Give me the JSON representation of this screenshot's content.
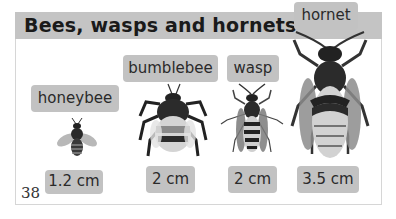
{
  "page": {
    "title": "Bees, wasps and hornets",
    "page_number": "38"
  },
  "insects": [
    {
      "name": "honeybee",
      "size": "1.2 cm",
      "icon": "honeybee-icon"
    },
    {
      "name": "bumblebee",
      "size": "2 cm",
      "icon": "bumblebee-icon"
    },
    {
      "name": "wasp",
      "size": "2 cm",
      "icon": "wasp-icon"
    },
    {
      "name": "hornet",
      "size": "3.5 cm",
      "icon": "hornet-icon"
    }
  ],
  "colors": {
    "header_band": "#c4c4c4",
    "label_bg": "#c2c2c2",
    "text": "#1e1e1e"
  }
}
